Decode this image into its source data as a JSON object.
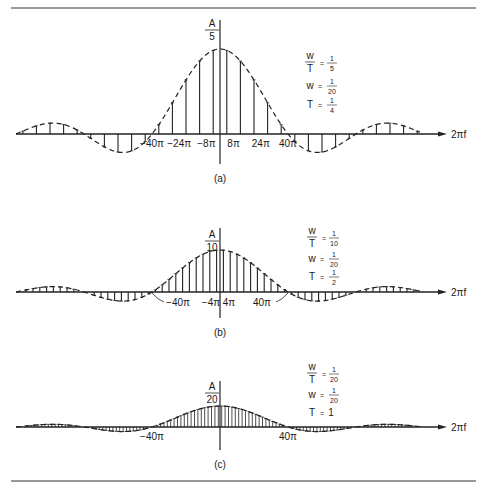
{
  "figure": {
    "rules": {
      "top_y": 8,
      "bottom_y": 481,
      "x1": 11,
      "x2": 476
    },
    "x_axis_label": "2πf",
    "panels": [
      {
        "id": "a",
        "caption": "(a)",
        "amplitude_label_num": "A",
        "amplitude_label_den": "5",
        "params": [
          {
            "lhs_num": "w",
            "lhs_den": "T",
            "rhs_num": "1",
            "rhs_den": "5"
          },
          {
            "lhs": "w",
            "rhs_num": "1",
            "rhs_den": "20"
          },
          {
            "lhs": "T",
            "rhs_num": "1",
            "rhs_den": "4"
          }
        ],
        "tick_labels": [
          "−40π",
          "−24π",
          "−8π",
          "8π",
          "24π",
          "40π"
        ],
        "tick_values_pi": [
          -40,
          -24,
          -8,
          8,
          24,
          40
        ]
      },
      {
        "id": "b",
        "caption": "(b)",
        "amplitude_label_num": "A",
        "amplitude_label_den": "10",
        "params": [
          {
            "lhs_num": "w",
            "lhs_den": "T",
            "rhs_num": "1",
            "rhs_den": "10"
          },
          {
            "lhs": "w",
            "rhs_num": "1",
            "rhs_den": "20"
          },
          {
            "lhs": "T",
            "rhs_num": "1",
            "rhs_den": "2"
          }
        ],
        "tick_labels": [
          "−40π",
          "−4π",
          "4π",
          "40π"
        ],
        "tick_values_pi": [
          -40,
          -4,
          4,
          40
        ]
      },
      {
        "id": "c",
        "caption": "(c)",
        "amplitude_label_num": "A",
        "amplitude_label_den": "20",
        "params": [
          {
            "lhs_num": "w",
            "lhs_den": "T",
            "rhs_num": "1",
            "rhs_den": "20"
          },
          {
            "lhs": "w",
            "rhs_num": "1",
            "rhs_den": "20"
          },
          {
            "lhs": "T",
            "rhs": "1"
          }
        ],
        "tick_labels": [
          "−40π",
          "40π"
        ],
        "tick_values_pi": [
          -40,
          40
        ]
      }
    ]
  },
  "chart_data": [
    {
      "type": "line",
      "title": "(a) Line spectrum, w/T = 1/5, w = 1/20, T = 1/4",
      "xlabel": "2πf",
      "ylabel": "A/5",
      "envelope": "sinc, zeros at ±40π, ±80π, ±120π",
      "peak": "A/5",
      "sample_spacing_pi": 8,
      "sample_positions_pi": [
        -116,
        -108,
        -100,
        -92,
        -84,
        -76,
        -68,
        -60,
        -52,
        -44,
        -36,
        -28,
        -20,
        -12,
        -4,
        4,
        12,
        20,
        28,
        36,
        44,
        52,
        60,
        68,
        76,
        84,
        92,
        100,
        108,
        116
      ],
      "xticks_pi": [
        -40,
        -24,
        -8,
        8,
        24,
        40
      ],
      "grid": false
    },
    {
      "type": "line",
      "title": "(b) Line spectrum, w/T = 1/10, w = 1/20, T = 1/2",
      "xlabel": "2πf",
      "ylabel": "A/10",
      "envelope": "sinc, zeros at ±40π, ±80π, ±120π",
      "peak": "A/10",
      "sample_spacing_pi": 4,
      "xticks_pi": [
        -40,
        -4,
        4,
        40
      ],
      "grid": false
    },
    {
      "type": "line",
      "title": "(c) Line spectrum, w/T = 1/20, w = 1/20, T = 1",
      "xlabel": "2πf",
      "ylabel": "A/20",
      "envelope": "sinc, zeros at ±40π, ±80π, ±120π",
      "peak": "A/20",
      "sample_spacing_pi": 2,
      "xticks_pi": [
        -40,
        40
      ],
      "grid": false
    }
  ]
}
